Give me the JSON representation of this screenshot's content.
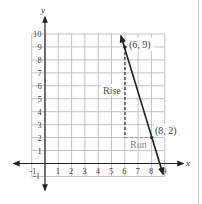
{
  "chart_data": {
    "type": "line",
    "title": "",
    "xlabel": "x",
    "ylabel": "y",
    "xlim": [
      -1,
      9
    ],
    "ylim": [
      -1,
      10
    ],
    "grid": true,
    "x_ticks": [
      "-1",
      "1",
      "2",
      "3",
      "4",
      "5",
      "6",
      "7",
      "8",
      "9"
    ],
    "y_ticks": [
      "-1",
      "1",
      "2",
      "3",
      "4",
      "5",
      "6",
      "7",
      "8",
      "9",
      "10"
    ],
    "series": [
      {
        "name": "line",
        "points": [
          {
            "x": 6,
            "y": 9
          },
          {
            "x": 8,
            "y": 2
          }
        ],
        "extends": {
          "from": {
            "x": 5.7,
            "y": 10
          },
          "to": {
            "x": 8.9,
            "y": -0.8
          }
        },
        "arrows": "both"
      }
    ],
    "annotations": [
      {
        "text": "(6, 9)",
        "x": 6,
        "y": 9
      },
      {
        "text": "(8, 2)",
        "x": 8,
        "y": 2
      },
      {
        "text": "Rise",
        "type": "dashed-vertical",
        "from": {
          "x": 6,
          "y": 9
        },
        "to": {
          "x": 6,
          "y": 2
        }
      },
      {
        "text": "Run",
        "type": "dashed-horizontal",
        "from": {
          "x": 6,
          "y": 2
        },
        "to": {
          "x": 8,
          "y": 2
        }
      }
    ]
  },
  "labels": {
    "x_axis": "x",
    "y_axis": "y",
    "point_a": "(6, 9)",
    "point_b": "(8, 2)",
    "rise": "Rise",
    "run": "Run"
  }
}
